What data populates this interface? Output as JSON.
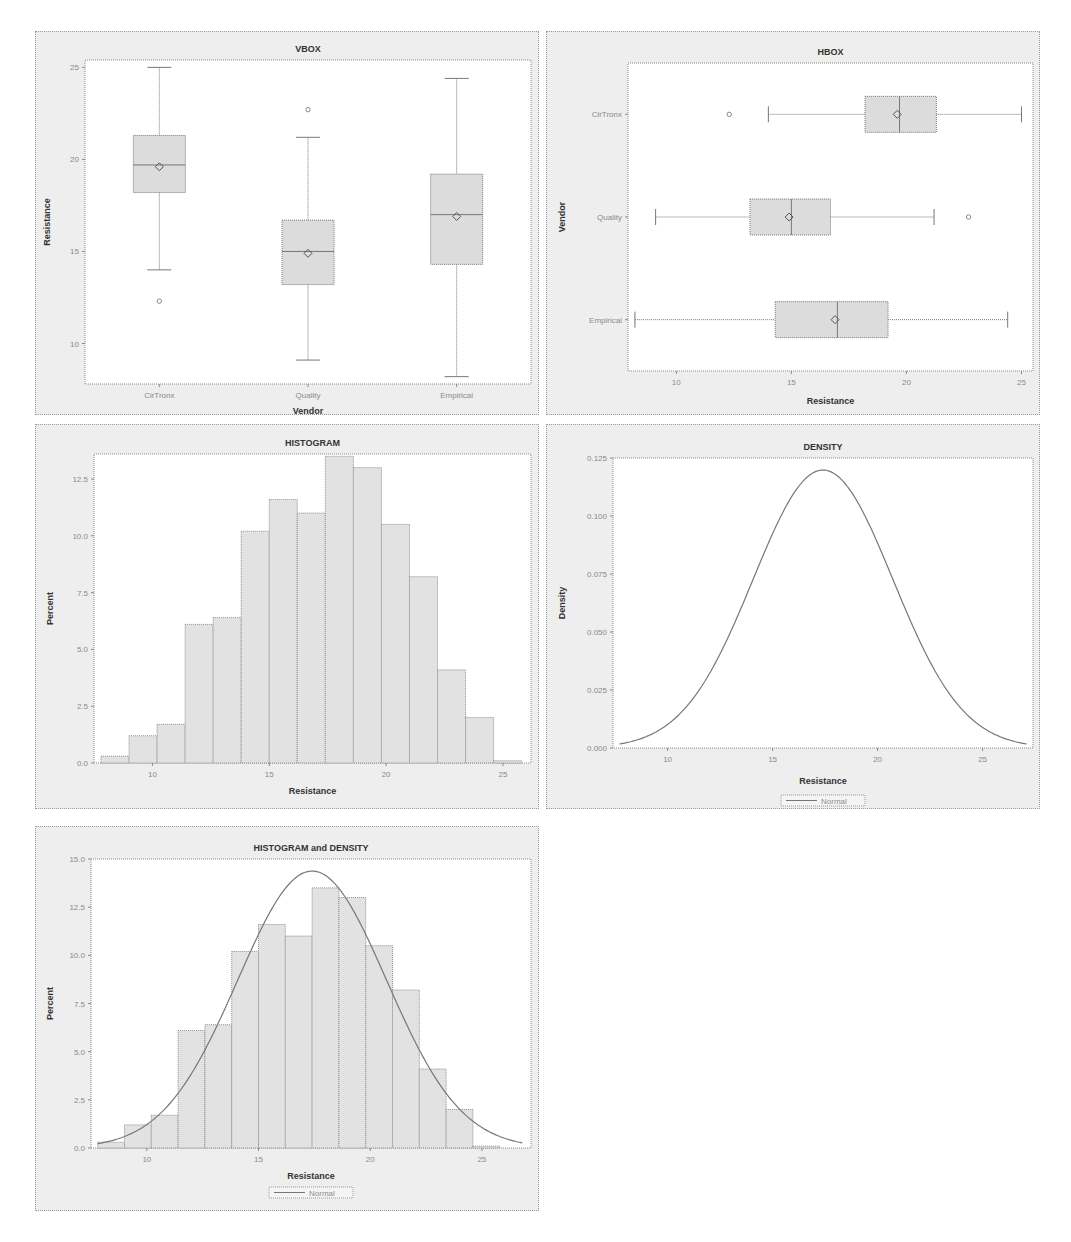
{
  "chart_data": [
    {
      "id": "vbox",
      "type": "box",
      "orientation": "vertical",
      "title": "VBOX",
      "xlabel": "Vendor",
      "ylabel": "Resistance",
      "ylim": [
        7.8,
        25.4
      ],
      "yticks": [
        10,
        15,
        20,
        25
      ],
      "categories": [
        "CirTronx",
        "Quality",
        "Empirical"
      ],
      "boxes": [
        {
          "category": "CirTronx",
          "min": 14.0,
          "q1": 18.2,
          "median": 19.7,
          "q3": 21.3,
          "max": 25.0,
          "mean": 19.6,
          "outliers": [
            12.3
          ]
        },
        {
          "category": "Quality",
          "min": 9.1,
          "q1": 13.2,
          "median": 15.0,
          "q3": 16.7,
          "max": 21.2,
          "mean": 14.9,
          "outliers": [
            22.7
          ]
        },
        {
          "category": "Empirical",
          "min": 8.2,
          "q1": 14.3,
          "median": 17.0,
          "q3": 19.2,
          "max": 24.4,
          "mean": 16.9,
          "outliers": []
        }
      ],
      "grid": false
    },
    {
      "id": "hbox",
      "type": "box",
      "orientation": "horizontal",
      "title": "HBOX",
      "xlabel": "Resistance",
      "ylabel": "Vendor",
      "xlim": [
        7.9,
        25.5
      ],
      "xticks": [
        10,
        15,
        20,
        25
      ],
      "categories": [
        "CirTronx",
        "Quality",
        "Empirical"
      ],
      "boxes": [
        {
          "category": "CirTronx",
          "min": 14.0,
          "q1": 18.2,
          "median": 19.7,
          "q3": 21.3,
          "max": 25.0,
          "mean": 19.6,
          "outliers": [
            12.3
          ]
        },
        {
          "category": "Quality",
          "min": 9.1,
          "q1": 13.2,
          "median": 15.0,
          "q3": 16.7,
          "max": 21.2,
          "mean": 14.9,
          "outliers": [
            22.7
          ]
        },
        {
          "category": "Empirical",
          "min": 8.2,
          "q1": 14.3,
          "median": 17.0,
          "q3": 19.2,
          "max": 24.4,
          "mean": 16.9,
          "outliers": []
        }
      ],
      "grid": false
    },
    {
      "id": "histogram",
      "type": "bar",
      "title": "HISTOGRAM",
      "xlabel": "Resistance",
      "ylabel": "Percent",
      "xlim": [
        7.5,
        26.2
      ],
      "ylim": [
        0,
        13.6
      ],
      "xticks": [
        10,
        15,
        20,
        25
      ],
      "yticks": [
        0.0,
        2.5,
        5.0,
        7.5,
        10.0,
        12.5
      ],
      "bin_width": 1.2,
      "bin_start": 7.8,
      "values": [
        0.3,
        1.2,
        1.7,
        6.1,
        6.4,
        10.2,
        11.6,
        11.0,
        13.5,
        13.0,
        10.5,
        8.2,
        4.1,
        2.0,
        0.1
      ],
      "grid": false
    },
    {
      "id": "density",
      "type": "line",
      "title": "DENSITY",
      "xlabel": "Resistance",
      "ylabel": "Density",
      "xlim": [
        7.4,
        27.4
      ],
      "ylim": [
        0,
        0.125
      ],
      "xticks": [
        10,
        15,
        20,
        25
      ],
      "yticks": [
        0.0,
        0.025,
        0.05,
        0.075,
        0.1,
        0.125
      ],
      "ytick_labels": [
        "0.000",
        "0.025",
        "0.050",
        "0.075",
        "0.100",
        "0.125"
      ],
      "series": [
        {
          "name": "Normal",
          "distribution": "normal",
          "mean": 17.4,
          "sd": 3.33
        }
      ],
      "legend": "bottom",
      "grid": false
    },
    {
      "id": "histdensity",
      "type": "bar",
      "title": "HISTOGRAM and DENSITY",
      "xlabel": "Resistance",
      "ylabel": "Percent",
      "xlim": [
        7.5,
        27.2
      ],
      "ylim": [
        0,
        15.0
      ],
      "xticks": [
        10,
        15,
        20,
        25
      ],
      "yticks": [
        0.0,
        2.5,
        5.0,
        7.5,
        10.0,
        12.5,
        15.0
      ],
      "bin_width": 1.2,
      "bin_start": 7.8,
      "values": [
        0.3,
        1.2,
        1.7,
        6.1,
        6.4,
        10.2,
        11.6,
        11.0,
        13.5,
        13.0,
        10.5,
        8.2,
        4.1,
        2.0,
        0.1
      ],
      "series": [
        {
          "name": "Normal",
          "distribution": "normal",
          "mean": 17.4,
          "sd": 3.33,
          "scale_percent": 120
        }
      ],
      "legend": "bottom",
      "grid": false
    }
  ],
  "colors": {
    "panel_bg": "#eeeeee",
    "plot_bg": "#ffffff",
    "box_fill": "#dcdcdc",
    "bar_fill": "#e2e2e2",
    "line": "#777777",
    "text": "#333333",
    "tick_text": "#8a8a8a"
  }
}
